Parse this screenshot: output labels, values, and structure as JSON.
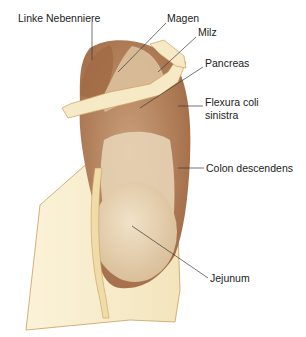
{
  "figure": {
    "colors": {
      "kidney_dark": "#a8704a",
      "kidney_mid": "#c49a72",
      "kidney_light": "#e6cfaf",
      "peritoneum": "#f7ecca",
      "peritoneum_edge": "#c8a05a",
      "leader_line": "#3a3a3a"
    },
    "labels": [
      {
        "id": "linke-nebenniere",
        "text": "Linke Nebenniere",
        "x": 18,
        "y": 17
      },
      {
        "id": "magen",
        "text": "Magen",
        "x": 167,
        "y": 17
      },
      {
        "id": "milz",
        "text": "Milz",
        "x": 198,
        "y": 31
      },
      {
        "id": "pancreas",
        "text": "Pancreas",
        "x": 205,
        "y": 62
      },
      {
        "id": "flexura-coli",
        "text": "Flexura coli",
        "x": 205,
        "y": 100
      },
      {
        "id": "flexura-coli-2",
        "text": "sinistra",
        "x": 205,
        "y": 113
      },
      {
        "id": "colon-descendens",
        "text": "Colon descendens",
        "x": 206,
        "y": 163
      },
      {
        "id": "jejunum",
        "text": "Jejunum",
        "x": 210,
        "y": 273
      }
    ]
  }
}
